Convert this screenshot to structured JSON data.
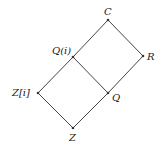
{
  "diagram": {
    "type": "lattice",
    "nodes": [
      {
        "id": "C",
        "label": "C",
        "x": 108,
        "y": 20
      },
      {
        "id": "Qi",
        "label": "Q(i)",
        "x": 73,
        "y": 57
      },
      {
        "id": "R",
        "label": "R",
        "x": 143,
        "y": 56
      },
      {
        "id": "Zi",
        "label": "Z[i]",
        "x": 38,
        "y": 93
      },
      {
        "id": "Q",
        "label": "Q",
        "x": 108,
        "y": 93
      },
      {
        "id": "Z",
        "label": "Z",
        "x": 73,
        "y": 128
      }
    ],
    "edges": [
      [
        "C",
        "Qi"
      ],
      [
        "C",
        "R"
      ],
      [
        "Qi",
        "Zi"
      ],
      [
        "Qi",
        "Q"
      ],
      [
        "R",
        "Q"
      ],
      [
        "Zi",
        "Z"
      ],
      [
        "Q",
        "Z"
      ]
    ]
  },
  "labels": {
    "C": "C",
    "Qi": "Q(i)",
    "R": "R",
    "Zi": "Z[i]",
    "Q": "Q",
    "Z": "Z"
  }
}
